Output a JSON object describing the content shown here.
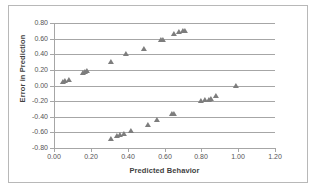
{
  "chart_data": {
    "type": "scatter",
    "title": "",
    "xlabel": "Predicted Behavior",
    "ylabel": "Error in Prediction",
    "xlim": [
      0.0,
      1.2
    ],
    "ylim": [
      -0.8,
      0.8
    ],
    "xticks": [
      "0.00",
      "0.20",
      "0.40",
      "0.60",
      "0.80",
      "1.00",
      "1.20"
    ],
    "yticks": [
      "0.80",
      "0.60",
      "0.40",
      "0.20",
      "0.00",
      "-0.20",
      "-0.40",
      "-0.60",
      "-0.80"
    ],
    "xtick_values": [
      0.0,
      0.2,
      0.4,
      0.6,
      0.8,
      1.0,
      1.2
    ],
    "ytick_values": [
      0.8,
      0.6,
      0.4,
      0.2,
      0.0,
      -0.2,
      -0.4,
      -0.6,
      -0.8
    ],
    "grid": "horizontal",
    "legend": "none",
    "marker": "triangle",
    "marker_color": "#7d7d7d",
    "series": [
      {
        "name": "Error in Prediction",
        "points": [
          [
            0.05,
            0.05
          ],
          [
            0.06,
            0.06
          ],
          [
            0.08,
            0.07
          ],
          [
            0.16,
            0.16
          ],
          [
            0.17,
            0.17
          ],
          [
            0.18,
            0.18
          ],
          [
            0.31,
            0.3
          ],
          [
            0.31,
            -0.69
          ],
          [
            0.34,
            -0.65
          ],
          [
            0.36,
            -0.63
          ],
          [
            0.38,
            -0.62
          ],
          [
            0.39,
            0.4
          ],
          [
            0.42,
            -0.58
          ],
          [
            0.49,
            0.47
          ],
          [
            0.51,
            -0.5
          ],
          [
            0.56,
            -0.44
          ],
          [
            0.58,
            0.58
          ],
          [
            0.59,
            0.58
          ],
          [
            0.64,
            -0.37
          ],
          [
            0.65,
            -0.36
          ],
          [
            0.65,
            0.66
          ],
          [
            0.68,
            0.69
          ],
          [
            0.7,
            0.7
          ],
          [
            0.71,
            0.7
          ],
          [
            0.8,
            -0.2
          ],
          [
            0.82,
            -0.19
          ],
          [
            0.84,
            -0.18
          ],
          [
            0.85,
            -0.17
          ],
          [
            0.88,
            -0.14
          ],
          [
            0.99,
            0.0
          ]
        ]
      }
    ]
  },
  "colors": {
    "grid": "#a6a6a6",
    "axis": "#a6a6a6",
    "tick_text": "#555555",
    "title_text": "#3f3f3f",
    "marker": "#7d7d7d",
    "frame": "#b8b8b8",
    "background": "#ffffff"
  }
}
